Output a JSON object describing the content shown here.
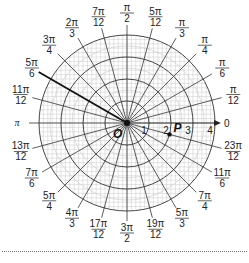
{
  "figure": {
    "type": "polar-grid",
    "center": {
      "x": 127,
      "y": 123
    },
    "outer_radius": 88,
    "ring_count": 4,
    "ring_labels": [
      "1",
      "2",
      "3",
      "4"
    ],
    "origin_label": "O",
    "polar_axis_label": "0",
    "point": {
      "label": "P",
      "r": 2,
      "theta_label": "23π/12"
    },
    "highlighted_ray": {
      "theta_label": "5π/6"
    },
    "angle_labels": [
      {
        "num": "",
        "den": "12",
        "top": "π",
        "deg": 15
      },
      {
        "num": "π",
        "den": "6",
        "deg": 30
      },
      {
        "num": "π",
        "den": "4",
        "deg": 45
      },
      {
        "num": "π",
        "den": "3",
        "deg": 60
      },
      {
        "num": "5π",
        "den": "12",
        "deg": 75
      },
      {
        "num": "π",
        "den": "2",
        "deg": 90
      },
      {
        "num": "7π",
        "den": "12",
        "deg": 105
      },
      {
        "num": "2π",
        "den": "3",
        "deg": 120
      },
      {
        "num": "3π",
        "den": "4",
        "deg": 135
      },
      {
        "num": "5π",
        "den": "6",
        "deg": 150
      },
      {
        "num": "11π",
        "den": "12",
        "deg": 165
      },
      {
        "num": "π",
        "den": "",
        "deg": 180
      },
      {
        "num": "13π",
        "den": "12",
        "deg": 195
      },
      {
        "num": "7π",
        "den": "6",
        "deg": 210
      },
      {
        "num": "5π",
        "den": "4",
        "deg": 225
      },
      {
        "num": "4π",
        "den": "3",
        "deg": 240
      },
      {
        "num": "17π",
        "den": "12",
        "deg": 255
      },
      {
        "num": "3π",
        "den": "2",
        "deg": 270
      },
      {
        "num": "19π",
        "den": "12",
        "deg": 285
      },
      {
        "num": "5π",
        "den": "3",
        "deg": 300
      },
      {
        "num": "7π",
        "den": "4",
        "deg": 315
      },
      {
        "num": "11π",
        "den": "6",
        "deg": 330
      },
      {
        "num": "23π",
        "den": "12",
        "deg": 345
      }
    ],
    "colors": {
      "grid_major": "#333333",
      "grid_minor": "#c8c8c8",
      "text": "#222222"
    }
  }
}
